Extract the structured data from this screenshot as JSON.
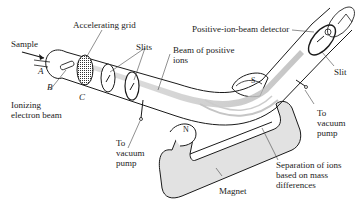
{
  "diagram": {
    "labels": {
      "sample": "Sample",
      "accelerating_grid": "Accelerating grid",
      "slits": "Slits",
      "beam_positive_ions": "Beam of positive\nions",
      "positive_ion_detector": "Positive-ion-beam detector",
      "slit": "Slit",
      "ionizing_beam": "Ionizing\nelectron beam",
      "vacuum_pump_left": "To\nvacuum\npump",
      "vacuum_pump_right": "To\nvacuum\npump",
      "separation": "Separation of ions\nbased on mass\ndifferences",
      "magnet": "Magnet",
      "pole_n": "N",
      "pole_s": "S",
      "point_a": "A",
      "point_b": "B",
      "point_c": "C"
    },
    "colors": {
      "line": "#1a1a1a",
      "magnet_fill": "#e2e2e2",
      "beam": "#c8c8c8",
      "grid_fill": "#555555"
    }
  }
}
